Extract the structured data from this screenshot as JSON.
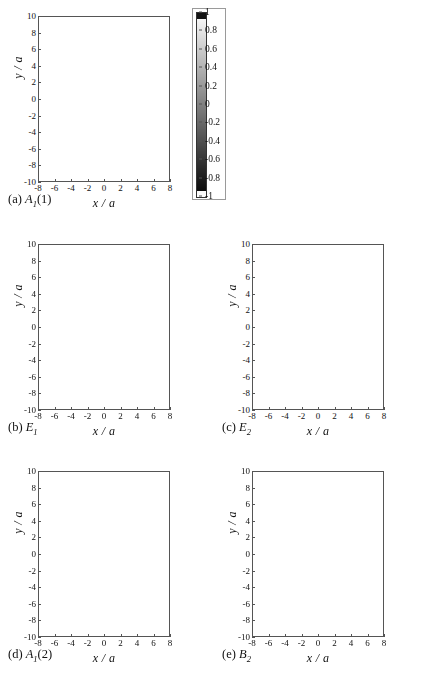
{
  "figure": {
    "type": "multi-panel-field-map",
    "panel_count": 5,
    "shared_axes": {
      "xlabel": "x / a",
      "ylabel": "y / a"
    }
  },
  "colorbar": {
    "name": "amplitude-colorbar",
    "min": -1,
    "max": 1,
    "colormap": "grayscale",
    "ticks": [
      1,
      0.8,
      0.6,
      0.4,
      0.2,
      0,
      -0.2,
      -0.4,
      -0.6,
      -0.8,
      -1
    ],
    "tick_labels": [
      "1",
      "0.8",
      "0.6",
      "0.4",
      "0.2",
      "0",
      "-0.2",
      "-0.4",
      "-0.6",
      "-0.8",
      "-1"
    ],
    "end_cap_top": "#1a1a1a",
    "end_cap_bottom": "#ffffff"
  },
  "axes": {
    "xticks": [
      -8,
      -6,
      -4,
      -2,
      0,
      2,
      4,
      6,
      8
    ],
    "xtick_labels": [
      "-8",
      "-6",
      "-4",
      "-2",
      "0",
      "2",
      "4",
      "6",
      "8"
    ],
    "yticks": [
      10,
      8,
      6,
      4,
      2,
      0,
      -2,
      -4,
      -6,
      -8,
      -10
    ],
    "ytick_labels": [
      "10",
      "8",
      "6",
      "4",
      "2",
      "0",
      "-2",
      "-4",
      "-6",
      "-8",
      "-10"
    ],
    "xlim": [
      -8,
      8
    ],
    "ylim": [
      -10,
      10
    ],
    "xlabel": "x / a",
    "ylabel": "y / a"
  },
  "domain": {
    "shape": "hexagon",
    "orientation": "pointy-top",
    "vertex_radius_y": 9.1,
    "half_width_x": 8.0,
    "flat_half_height_y": 4.55,
    "background_level": -0.06
  },
  "panels": [
    {
      "id": "a",
      "name": "panel-a",
      "caption_prefix": "(a)",
      "symbol": "A",
      "symbol_sub": "1",
      "symbol_suffix": "(1)",
      "caption_plain": "(a) A1(1)",
      "mode_description": "nodeless breathing monopole, single bright core",
      "pattern": "monopole",
      "core_sign": 1,
      "core_amplitude": 1.0,
      "core_radius": 0.55,
      "ring_count": 2,
      "lobe_count": 0,
      "lattice_amplitude": 0.04,
      "decay": 1.9
    },
    {
      "id": "b",
      "name": "panel-b",
      "caption_prefix": "(b)",
      "symbol": "E",
      "symbol_sub": "1",
      "symbol_suffix": "",
      "caption_plain": "(b) E1",
      "mode_description": "dipole, one dark and one bright lobe across x",
      "pattern": "dipole",
      "core_sign": -1,
      "core_amplitude": 1.0,
      "core_radius": 0.5,
      "ring_count": 1,
      "lobe_count": 2,
      "lattice_amplitude": 0.13,
      "decay": 2.2
    },
    {
      "id": "c",
      "name": "panel-c",
      "caption_prefix": "(c)",
      "symbol": "E",
      "symbol_sub": "2",
      "symbol_suffix": "",
      "caption_plain": "(c) E2",
      "mode_description": "quadrupole, four alternating lobes",
      "pattern": "quadrupole",
      "core_sign": -1,
      "core_amplitude": 1.0,
      "core_radius": 0.42,
      "ring_count": 1,
      "lobe_count": 4,
      "lattice_amplitude": 0.11,
      "decay": 2.4
    },
    {
      "id": "d",
      "name": "panel-d",
      "caption_prefix": "(d)",
      "symbol": "A",
      "symbol_sub": "1",
      "symbol_suffix": "(2)",
      "caption_plain": "(d) A1(2)",
      "mode_description": "second radial monopole, bright core inside dark annulus",
      "pattern": "ring-monopole",
      "core_sign": 1,
      "core_amplitude": 1.0,
      "core_radius": 0.4,
      "ring_count": 3,
      "lobe_count": 0,
      "lattice_amplitude": 0.05,
      "decay": 2.0
    },
    {
      "id": "e",
      "name": "panel-e",
      "caption_prefix": "(e)",
      "symbol": "B",
      "symbol_sub": "2",
      "symbol_suffix": "",
      "caption_plain": "(e) B2",
      "mode_description": "six-fold hexagonal pattern, strong alternating lobes over wide region",
      "pattern": "hexapole",
      "core_sign": -1,
      "core_amplitude": 1.0,
      "core_radius": 0.7,
      "ring_count": 3,
      "lobe_count": 6,
      "lattice_amplitude": 0.3,
      "decay": 0.55
    }
  ],
  "chart_data": {
    "type": "heatmap",
    "title": "",
    "xlabel": "x / a",
    "ylabel": "y / a",
    "xlim": [
      -8,
      8
    ],
    "ylim": [
      -10,
      10
    ],
    "zlim": [
      -1,
      1
    ],
    "colormap": "gray",
    "grid": false,
    "legend": "colorbar-right-of-panel-a",
    "panel_labels": [
      "(a) A1(1)",
      "(b) E1",
      "(c) E2",
      "(d) A1(2)",
      "(e) B2"
    ]
  }
}
